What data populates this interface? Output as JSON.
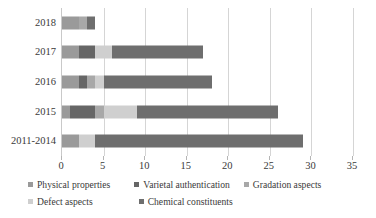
{
  "chart_data": {
    "type": "bar",
    "orientation": "horizontal",
    "stacked": true,
    "title": "",
    "subtitle": "",
    "xlabel": "",
    "ylabel": "",
    "xlim": [
      0,
      35
    ],
    "ylim": null,
    "grid": true,
    "gridlines_axis": "x",
    "legend_position": "bottom",
    "categories": [
      "2018",
      "2017",
      "2016",
      "2015",
      "2011-2014"
    ],
    "xticks": [
      0,
      5,
      10,
      15,
      20,
      25,
      30,
      35
    ],
    "xtick_labels": [
      "0",
      "5",
      "10",
      "15",
      "20",
      "25",
      "30",
      "35"
    ],
    "series": [
      {
        "name": "Physical properties",
        "color": "#9a9a9a",
        "values": [
          2,
          2,
          2,
          1,
          2
        ]
      },
      {
        "name": "Varietal authentication",
        "color": "#666666",
        "values": [
          0,
          2,
          1,
          3,
          0
        ]
      },
      {
        "name": "Gradation aspects",
        "color": "#a8a8a8",
        "values": [
          1,
          0,
          1,
          1,
          0
        ]
      },
      {
        "name": "Defect aspects",
        "color": "#cfcfcf",
        "values": [
          0,
          2,
          1,
          4,
          2
        ]
      },
      {
        "name": "Chemical constituents",
        "color": "#6e6e6e",
        "values": [
          1,
          11,
          13,
          17,
          25
        ]
      }
    ],
    "totals": [
      4,
      17,
      18,
      26,
      29
    ]
  },
  "legend": {
    "rows": [
      [
        {
          "label": "Physical properties",
          "color": "#9a9a9a"
        },
        {
          "label": "Varietal authentication",
          "color": "#666666"
        },
        {
          "label": "Gradation aspects",
          "color": "#a8a8a8"
        }
      ],
      [
        {
          "label": "Defect aspects",
          "color": "#cfcfcf"
        },
        {
          "label": "Chemical constituents",
          "color": "#6e6e6e"
        }
      ]
    ]
  },
  "axis": {
    "gridline_color": "#d5d5d5",
    "axis_line_color": "#c9c9c9",
    "text_color": "#3a3a3a"
  }
}
